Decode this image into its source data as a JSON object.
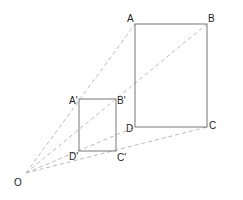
{
  "diagram": {
    "title": "",
    "labels": {
      "A": "A",
      "B": "B",
      "C": "C",
      "D": "D",
      "A1": "A'",
      "B1": "B'",
      "C1": "C'",
      "D1": "D'",
      "O": "O"
    },
    "colors": {
      "rect": "#777777",
      "ray": "#bbbbbb",
      "text": "#222222"
    }
  }
}
